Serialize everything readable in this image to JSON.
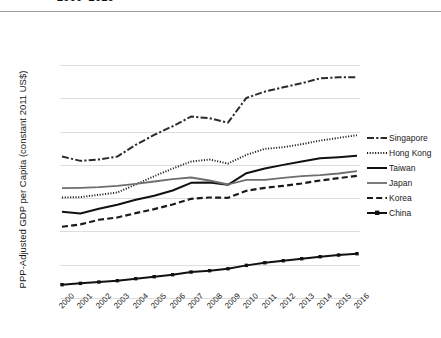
{
  "chart_data": {
    "type": "line",
    "title": "2000–2016",
    "xlabel": "",
    "ylabel": "PPP-Adjusted GDP per Capita (constant 2011 US$)",
    "x": [
      2000,
      2001,
      2002,
      2003,
      2004,
      2005,
      2006,
      2007,
      2008,
      2009,
      2010,
      2011,
      2012,
      2013,
      2014,
      2015,
      2016
    ],
    "categories": [
      "2000",
      "2001",
      "2002",
      "2003",
      "2004",
      "2005",
      "2006",
      "2007",
      "2008",
      "2009",
      "2010",
      "2011",
      "2012",
      "2013",
      "2014",
      "2015",
      "2016"
    ],
    "ylim": [
      0,
      70000
    ],
    "yticks": [
      0,
      10000,
      20000,
      30000,
      40000,
      50000,
      60000,
      70000
    ],
    "ytick_labels": [
      "0",
      "10,000",
      "20,000",
      "30,000",
      "40,000",
      "50,000",
      "60,000",
      "70,000"
    ],
    "grid": true,
    "legend_position": "right",
    "series": [
      {
        "name": "Singapore",
        "style": "dash-dot",
        "color": "#2b2b2b",
        "values": [
          42500,
          41200,
          41600,
          42500,
          46000,
          49000,
          51600,
          54500,
          54000,
          52700,
          60100,
          62000,
          63300,
          64500,
          66000,
          66300,
          66300
        ]
      },
      {
        "name": "Hong Kong",
        "style": "dotted",
        "color": "#1a1a1a",
        "values": [
          30200,
          30300,
          31000,
          31700,
          34100,
          36600,
          38900,
          41000,
          41600,
          40400,
          43000,
          44800,
          45300,
          46200,
          47300,
          48100,
          48900
        ]
      },
      {
        "name": "Taiwan",
        "style": "solid",
        "color": "#111111",
        "values": [
          25900,
          25400,
          26800,
          28000,
          29500,
          30700,
          32300,
          34600,
          34700,
          34000,
          37500,
          38900,
          40000,
          41000,
          42000,
          42300,
          42700
        ]
      },
      {
        "name": "Japan",
        "style": "solid-gray",
        "color": "#6e6e6e",
        "values": [
          33000,
          33100,
          33300,
          33700,
          34300,
          35000,
          35700,
          36200,
          35300,
          34100,
          35500,
          35500,
          36100,
          36600,
          36900,
          37400,
          38100
        ]
      },
      {
        "name": "Korea",
        "style": "dashed",
        "color": "#1a1a1a",
        "values": [
          21400,
          22100,
          23500,
          24200,
          25500,
          26700,
          28100,
          29800,
          30200,
          30100,
          32200,
          33100,
          33700,
          34400,
          35300,
          36000,
          36700
        ]
      },
      {
        "name": "China",
        "style": "solid-marker",
        "color": "#111111",
        "values": [
          4000,
          4400,
          4800,
          5200,
          5800,
          6400,
          7000,
          7800,
          8200,
          8800,
          9800,
          10600,
          11200,
          11800,
          12400,
          12900,
          13300
        ]
      }
    ]
  },
  "legend": {
    "items": [
      {
        "label": "Singapore"
      },
      {
        "label": "Hong Kong"
      },
      {
        "label": "Taiwan"
      },
      {
        "label": "Japan"
      },
      {
        "label": "Korea"
      },
      {
        "label": "China"
      }
    ]
  }
}
